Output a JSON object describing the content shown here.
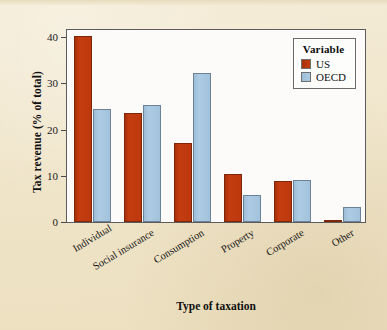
{
  "chart_data": {
    "type": "bar",
    "title": "",
    "xlabel": "Type of taxation",
    "ylabel": "Tax revenue (% of total)",
    "categories": [
      "Individual",
      "Social insurance",
      "Consumption",
      "Property",
      "Corporate",
      "Other"
    ],
    "series": [
      {
        "name": "US",
        "values": [
          40.3,
          23.6,
          17.0,
          10.4,
          8.8,
          0.3
        ]
      },
      {
        "name": "OECD",
        "values": [
          24.5,
          25.3,
          32.3,
          5.9,
          9.1,
          3.3
        ]
      }
    ],
    "ylim": [
      0,
      42
    ],
    "yticks": [
      0,
      10,
      20,
      30,
      40
    ],
    "ytick_labels": [
      "0",
      "10",
      "20",
      "30",
      "40"
    ],
    "grid": false,
    "legend": {
      "title": "Variable",
      "position": "top-right"
    },
    "colors": {
      "US": "#c0390e",
      "OECD": "#a8c8e0",
      "background": "#f1e7ce",
      "panel": "#fcfbfa",
      "axis": "#4a4a4a"
    }
  },
  "axes": {
    "y_title": "Tax revenue (% of total)",
    "x_title": "Type of taxation",
    "y_tick_0": "0",
    "y_tick_1": "10",
    "y_tick_2": "20",
    "y_tick_3": "30",
    "y_tick_4": "40"
  },
  "legend": {
    "title": "Variable",
    "entries": [
      {
        "label": "US",
        "color": "#c0390e"
      },
      {
        "label": "OECD",
        "color": "#a8c8e0"
      }
    ]
  }
}
